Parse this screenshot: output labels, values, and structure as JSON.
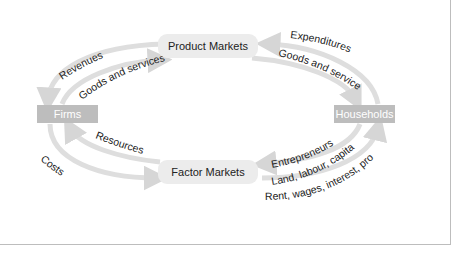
{
  "diagram": {
    "nodes": {
      "product_markets": "Product Markets",
      "factor_markets": "Factor Markets",
      "firms": "Firms",
      "households": "Households"
    },
    "flows": {
      "revenues": "Revenues",
      "goods_and_services_firms": "Goods and services",
      "expenditures": "Expenditures",
      "goods_and_services_households": "Goods and services",
      "resources": "Resources",
      "costs": "Costs",
      "entrepreneurs": "Entrepreneurs",
      "land_labour_capital": "Land, labour, capital",
      "rent_wages_interest_profit": "Rent, wages, interest, profit"
    },
    "colors": {
      "arrow": "#dcdcdc",
      "market_box": "#ececec",
      "agent_box": "#bdbdbd",
      "frame": "#bdbdbd"
    }
  }
}
